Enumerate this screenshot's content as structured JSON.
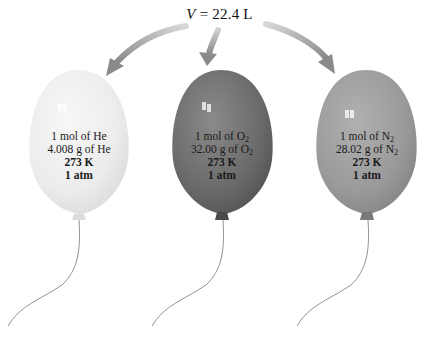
{
  "title": {
    "variable": "V",
    "equals": " = ",
    "value": "22.4 L"
  },
  "balloons": [
    {
      "gas": "He",
      "color": "#eeeeee",
      "line1_prefix": "1 mol of He",
      "line1_sub": "",
      "line2_prefix": "4.008 g of He",
      "line2_sub": "",
      "temperature": "273 K",
      "pressure": "1 atm"
    },
    {
      "gas": "O2",
      "color": "#6e6e6e",
      "line1_prefix": "1 mol of O",
      "line1_sub": "2",
      "line2_prefix": "32.00 g of O",
      "line2_sub": "2",
      "temperature": "273 K",
      "pressure": "1 atm"
    },
    {
      "gas": "N2",
      "color": "#9a9a9a",
      "line1_prefix": "1 mol of N",
      "line1_sub": "2",
      "line2_prefix": "28.02 g of N",
      "line2_sub": "2",
      "temperature": "273 K",
      "pressure": "1 atm"
    }
  ],
  "colors": {
    "arrow": "#8c8c8c",
    "string": "#777777"
  }
}
